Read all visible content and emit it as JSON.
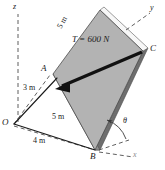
{
  "figure": {
    "type": "engineering-mechanics-free-body-diagram"
  },
  "axes": [
    {
      "name": "z-axis",
      "label": "z",
      "style": "dashed",
      "direction": "up"
    },
    {
      "name": "y-axis",
      "label": "y",
      "style": "dashed",
      "direction": "upper-right"
    },
    {
      "name": "x-axis",
      "label": "x",
      "style": "dashed",
      "direction": "lower-right"
    }
  ],
  "points": [
    {
      "name": "origin",
      "label": "O"
    },
    {
      "name": "point-a",
      "label": "A"
    },
    {
      "name": "point-b",
      "label": "B"
    },
    {
      "name": "point-c",
      "label": "C"
    }
  ],
  "dimensions": [
    {
      "name": "dim-oa-height",
      "label": "3 m",
      "between": "O to A height along z"
    },
    {
      "name": "dim-plate-edge",
      "label": "5 m",
      "between": "A to plate top corner"
    },
    {
      "name": "dim-ob",
      "label": "5 m",
      "between": "O to B"
    },
    {
      "name": "dim-ox",
      "label": "4 m",
      "between": "O along x"
    }
  ],
  "force": {
    "name": "cable-tension",
    "label": "T = 600 N",
    "magnitude": 600,
    "unit": "N",
    "symbol": "T",
    "applied_at": "C",
    "directed_toward": "O"
  },
  "angle": {
    "name": "plate-angle",
    "label": "θ",
    "vertex": "B",
    "between": "plate edge and x-axis"
  },
  "colors": {
    "plate_face": "#b3b3b3",
    "plate_edge_dark": "#6e6e6e",
    "plate_edge_light": "#f2f2f2",
    "line": "#1a1a1a",
    "dashed": "#4d4d4d",
    "background": "#ffffff"
  }
}
